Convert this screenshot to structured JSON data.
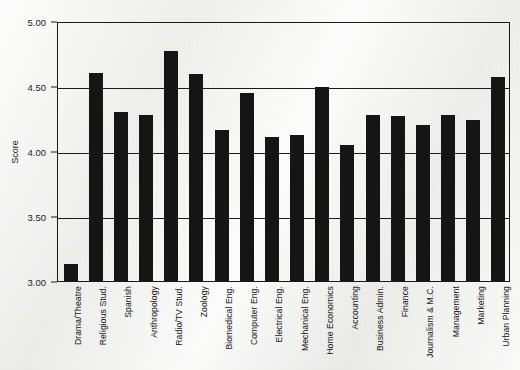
{
  "chart_data": {
    "type": "bar",
    "title": "",
    "xlabel": "",
    "ylabel": "Score",
    "ylim": [
      3.0,
      5.0
    ],
    "ytick_labels": [
      "5.00",
      "4.50",
      "4.00",
      "3.50",
      "3.00"
    ],
    "ytick_values": [
      5.0,
      4.5,
      4.0,
      3.5,
      3.0
    ],
    "grid": true,
    "legend": "none",
    "bar_color": "#151515",
    "axis_color": "#1a1a1a",
    "background_color": "#f2f2f0",
    "categories": [
      "Drama/Theatre",
      "Religious Stud.",
      "Spanish",
      "Anthropology",
      "Radio/TV Stud.",
      "Zoology",
      "Biomedical Eng.",
      "Computer Eng.",
      "Electrical Eng.",
      "Mechanical Eng.",
      "Home Economics",
      "Accounting",
      "Business Admin.",
      "Finance",
      "Journalism & M.C.",
      "Management",
      "Marketing",
      "Urban Planning"
    ],
    "values": [
      3.13,
      4.6,
      4.3,
      4.28,
      4.77,
      4.59,
      4.16,
      4.45,
      4.11,
      4.12,
      4.49,
      4.05,
      4.28,
      4.27,
      4.2,
      4.28,
      4.24,
      4.57
    ]
  }
}
